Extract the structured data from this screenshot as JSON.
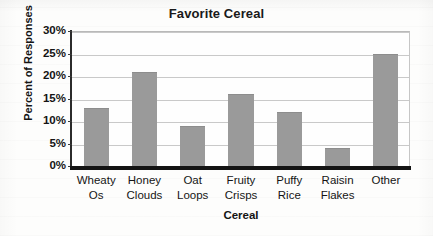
{
  "chart_data": {
    "type": "bar",
    "title": "Favorite Cereal",
    "xlabel": "Cereal",
    "ylabel": "Percent of Responses",
    "categories": [
      "Wheaty Os",
      "Honey Clouds",
      "Oat Loops",
      "Fruity Crisps",
      "Puffy Rice",
      "Raisin Flakes",
      "Other"
    ],
    "category_lines": [
      [
        "Wheaty",
        "Os"
      ],
      [
        "Honey",
        "Clouds"
      ],
      [
        "Oat",
        "Loops"
      ],
      [
        "Fruity",
        "Crisps"
      ],
      [
        "Puffy",
        "Rice"
      ],
      [
        "Raisin",
        "Flakes"
      ],
      [
        "Other",
        ""
      ]
    ],
    "values": [
      13,
      21,
      9,
      16,
      12,
      4,
      25
    ],
    "ylim": [
      0,
      30
    ],
    "ytick_values": [
      0,
      5,
      10,
      15,
      20,
      25,
      30
    ],
    "ytick_labels": [
      "0%",
      "5%",
      "10%",
      "15%",
      "20%",
      "25%",
      "30%"
    ],
    "grid": true,
    "legend": false,
    "bar_color": "#9a9a9a",
    "gridline_color": "#c9c9c9",
    "axis_color": "#141414",
    "background_color": "#fdfdfc"
  }
}
